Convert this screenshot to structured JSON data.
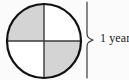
{
  "figure": {
    "name": "quartered-circle-with-year-brace",
    "background_color": "#fbfbfb"
  },
  "diagram": {
    "shape": "circle",
    "center_x": 44,
    "center_y": 41,
    "radius": 37,
    "outline_color": "#111111",
    "outline_width": 2,
    "divider_color": "#333333",
    "divider_width": 1.4,
    "shaded_color": "#d4d4d4",
    "unshaded_color": "#ffffff",
    "quadrants": [
      {
        "name": "top-left",
        "shaded": true,
        "fill": "#d4d4d4"
      },
      {
        "name": "top-right",
        "shaded": false,
        "fill": "#ffffff"
      },
      {
        "name": "bottom-left",
        "shaded": false,
        "fill": "#ffffff"
      },
      {
        "name": "bottom-right",
        "shaded": true,
        "fill": "#d4d4d4"
      }
    ],
    "shaded_fraction": "2/4"
  },
  "brace": {
    "label": "1 year",
    "orientation": "vertical-right",
    "color": "#2b2b2b",
    "span_top": 2,
    "span_bottom": 78,
    "tip_x": 95,
    "tip_y": 40
  }
}
